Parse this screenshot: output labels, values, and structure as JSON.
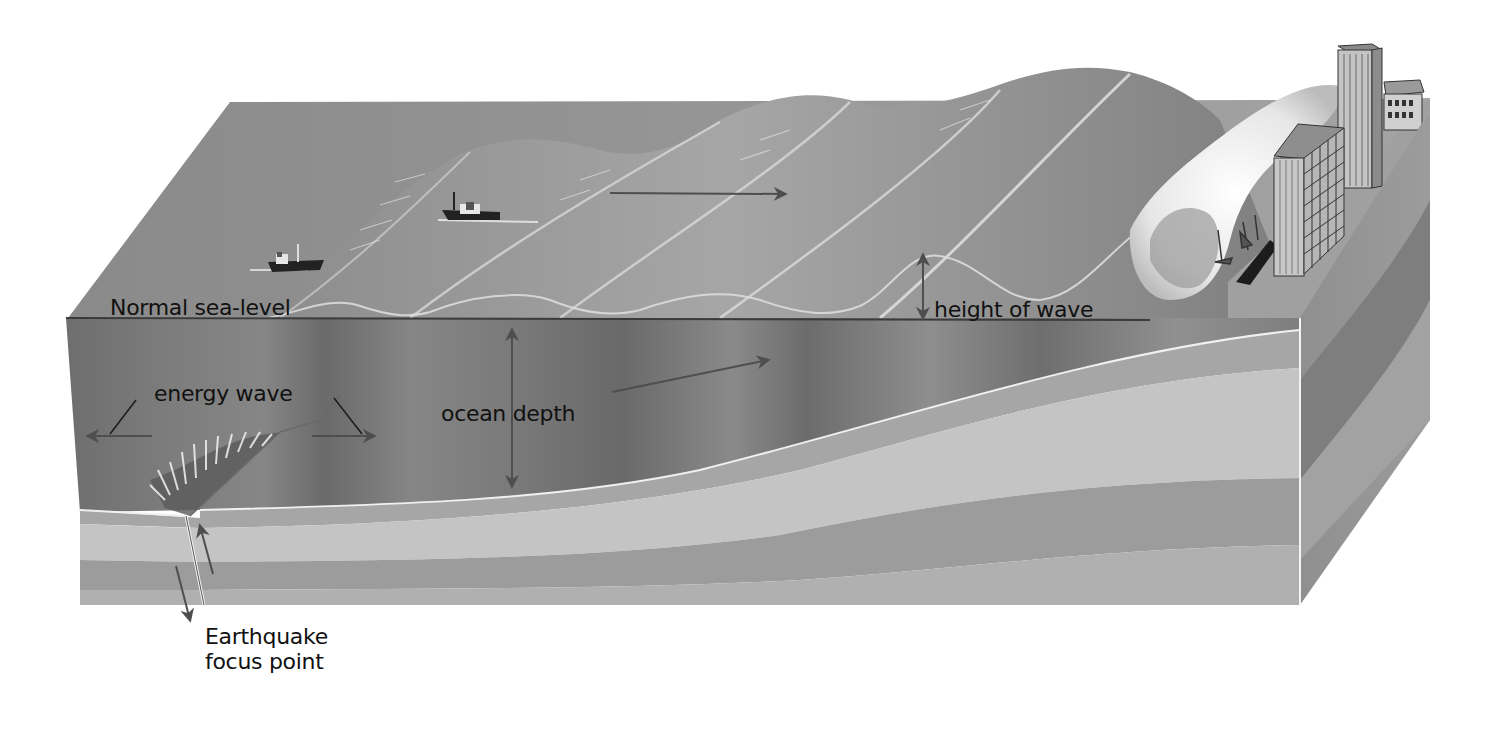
{
  "diagram": {
    "type": "block-diagram",
    "colors": {
      "background": "#ffffff",
      "ocean_surface": "#8e8e8e",
      "ocean_section": "#7a7a7a",
      "layer_1": "#a8a8a8",
      "layer_2": "#c2c2c2",
      "layer_3": "#9c9c9c",
      "layer_4": "#b4b4b4",
      "side_face": "#8a8a8a",
      "arrow": "#555555",
      "label_text": "#111111"
    }
  },
  "labels": {
    "normal_sea_level": "Normal sea-level",
    "height_of_wave": "height of wave",
    "energy_wave": "energy wave",
    "ocean_depth": "ocean depth",
    "earthquake_focus_point": "Earthquake\nfocus point"
  },
  "elements": {
    "ships": [
      {
        "name": "ship-left",
        "x": 270,
        "y": 262
      },
      {
        "name": "ship-center",
        "x": 445,
        "y": 212
      }
    ],
    "arrows": [
      {
        "name": "wave-direction-arrow",
        "from": [
          610,
          193
        ],
        "to": [
          785,
          193
        ]
      },
      {
        "name": "energy-wave-left-arrow",
        "from": [
          152,
          436
        ],
        "to": [
          88,
          436
        ]
      },
      {
        "name": "energy-wave-right-arrow",
        "from": [
          312,
          436
        ],
        "to": [
          374,
          436
        ]
      },
      {
        "name": "ocean-depth-arrow",
        "from": [
          512,
          320
        ],
        "to": [
          512,
          486
        ]
      },
      {
        "name": "undersea-propagation-arrow",
        "from": [
          612,
          392
        ],
        "to": [
          768,
          358
        ]
      },
      {
        "name": "height-of-wave-arrow",
        "from": [
          923,
          255
        ],
        "to": [
          923,
          318
        ]
      },
      {
        "name": "fault-up-arrow",
        "from": [
          213,
          572
        ],
        "to": [
          200,
          525
        ]
      },
      {
        "name": "fault-down-arrow",
        "from": [
          176,
          566
        ],
        "to": [
          190,
          618
        ]
      }
    ],
    "buildings_count": 3
  }
}
